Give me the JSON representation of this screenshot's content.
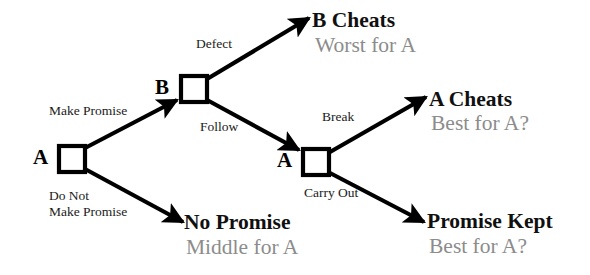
{
  "diagram": {
    "colors": {
      "edge": "#000000",
      "node_stroke": "#000000",
      "node_fill": "#ffffff",
      "outcome_text": "#101010",
      "evaluation_text": "#8c8c8c",
      "background": "#ffffff"
    },
    "nodes": [
      {
        "id": "node-a-root",
        "player_label": "A"
      },
      {
        "id": "node-b",
        "player_label": "B"
      },
      {
        "id": "node-a-second",
        "player_label": "A"
      }
    ],
    "edges": [
      {
        "id": "edge-make-promise",
        "label": "Make Promise"
      },
      {
        "id": "edge-do-not-make-promise",
        "label_line1": "Do Not",
        "label_line2": "Make Promise"
      },
      {
        "id": "edge-defect",
        "label": "Defect"
      },
      {
        "id": "edge-follow",
        "label": "Follow"
      },
      {
        "id": "edge-break",
        "label": "Break"
      },
      {
        "id": "edge-carry-out",
        "label": "Carry Out"
      }
    ],
    "outcomes": [
      {
        "id": "outcome-b-cheats",
        "name": "B Cheats",
        "evaluation": "Worst for A"
      },
      {
        "id": "outcome-a-cheats",
        "name": "A Cheats",
        "evaluation": "Best for A?"
      },
      {
        "id": "outcome-promise-kept",
        "name": "Promise Kept",
        "evaluation": "Best for A?"
      },
      {
        "id": "outcome-no-promise",
        "name": "No Promise",
        "evaluation": "Middle for A"
      }
    ]
  }
}
